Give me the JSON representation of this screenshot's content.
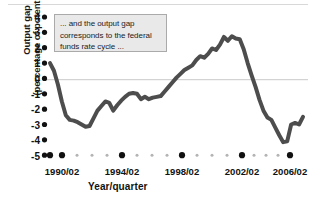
{
  "chart_data": {
    "type": "line",
    "title": "",
    "annotation": "... and the output gap corresponds to the federal funds rate cycle ...",
    "annotation_lines": [
      "... and the output gap",
      "corresponds to the federal",
      "funds rate cycle ..."
    ],
    "xlabel": "Year/quarter",
    "ylabel_lines": [
      "Output gap",
      "(percentage of potential GDP)"
    ],
    "ylabel": "Output gap (percentage of potential GDP)",
    "ylim": [
      -5,
      4
    ],
    "yticks": [
      4,
      3,
      2,
      1,
      0,
      -1,
      -2,
      -3,
      -4,
      -5
    ],
    "ytick_labels": [
      "4",
      "3",
      "2",
      "1",
      "0",
      "-1",
      "-2",
      "-3",
      "-4",
      "-5"
    ],
    "xlim": [
      "1990/02",
      "2006/02"
    ],
    "xticks": [
      "1990/02",
      "1994/02",
      "1998/02",
      "2002/02",
      "2006/02"
    ],
    "xtick_minor_count_between": 3,
    "grid": "zero-line-only",
    "legend": "none",
    "line_color": "#4d4d4d",
    "line_width_px": 4,
    "zero_line_color": "#c9c9c9",
    "series": [
      {
        "name": "Output gap",
        "x": [
          "1990/02",
          "1990/03",
          "1990/04",
          "1991/01",
          "1991/02",
          "1991/03",
          "1991/04",
          "1992/01",
          "1992/02",
          "1992/03",
          "1992/04",
          "1993/01",
          "1993/02",
          "1993/03",
          "1993/04",
          "1994/01",
          "1994/02",
          "1994/03",
          "1994/04",
          "1995/01",
          "1995/02",
          "1995/03",
          "1995/04",
          "1996/01",
          "1996/02",
          "1996/03",
          "1996/04",
          "1997/01",
          "1997/02",
          "1997/03",
          "1997/04",
          "1998/01",
          "1998/02",
          "1998/03",
          "1998/04",
          "1999/01",
          "1999/02",
          "1999/03",
          "1999/04",
          "2000/01",
          "2000/02",
          "2000/03",
          "2000/04",
          "2001/01",
          "2001/02",
          "2001/03",
          "2001/04",
          "2002/01",
          "2002/02",
          "2002/03",
          "2002/04",
          "2003/01",
          "2003/02",
          "2003/03",
          "2003/04",
          "2004/01",
          "2004/02",
          "2004/03",
          "2004/04",
          "2005/01",
          "2005/02",
          "2005/03",
          "2005/04",
          "2006/01",
          "2006/02"
        ],
        "values": [
          1.0,
          0.5,
          -0.4,
          -1.5,
          -2.4,
          -2.7,
          -2.75,
          -2.85,
          -3.0,
          -3.15,
          -3.1,
          -2.6,
          -2.1,
          -1.8,
          -1.5,
          -1.6,
          -2.1,
          -1.75,
          -1.45,
          -1.2,
          -1.0,
          -0.95,
          -1.0,
          -1.35,
          -1.2,
          -1.35,
          -1.25,
          -1.2,
          -1.15,
          -0.85,
          -0.55,
          -0.25,
          0.05,
          0.3,
          0.55,
          0.7,
          0.85,
          1.2,
          1.45,
          1.35,
          1.6,
          1.95,
          1.85,
          2.2,
          2.7,
          2.45,
          2.75,
          2.6,
          2.55,
          1.9,
          1.0,
          0.2,
          -0.55,
          -1.4,
          -2.1,
          -2.55,
          -2.7,
          -3.2,
          -3.7,
          -4.15,
          -4.1,
          -3.0,
          -2.9,
          -3.0,
          -2.5
        ]
      }
    ]
  }
}
